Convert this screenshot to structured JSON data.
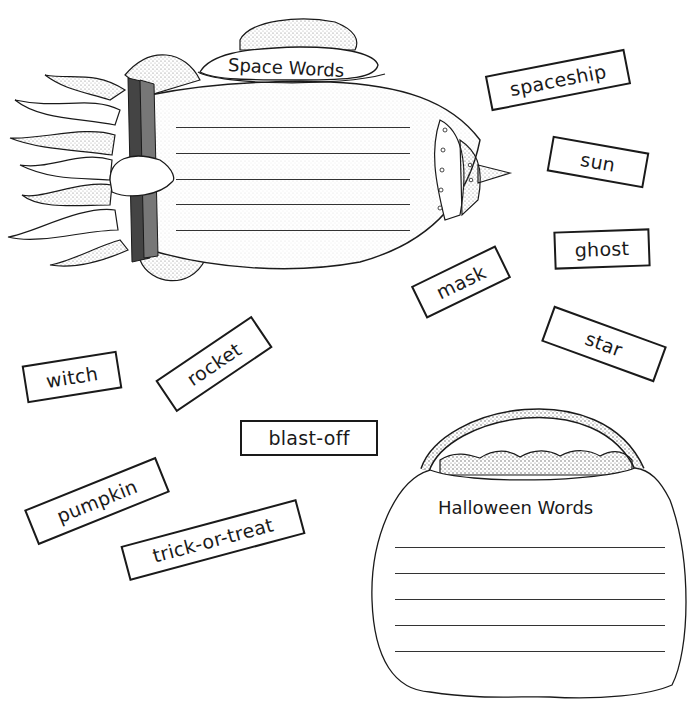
{
  "worksheet": {
    "space_box": {
      "title": "Space Words",
      "line_count": 5
    },
    "halloween_box": {
      "title": "Halloween Words",
      "line_count": 5
    },
    "word_cards": [
      {
        "id": "spaceship",
        "label": "spaceship",
        "x": 487,
        "y": 60,
        "w": 142,
        "h": 36,
        "rot": -11
      },
      {
        "id": "sun",
        "label": "sun",
        "x": 549,
        "y": 145,
        "w": 98,
        "h": 36,
        "rot": 10
      },
      {
        "id": "ghost",
        "label": "ghost",
        "x": 554,
        "y": 230,
        "w": 96,
        "h": 38,
        "rot": -2
      },
      {
        "id": "mask",
        "label": "mask",
        "x": 415,
        "y": 263,
        "w": 94,
        "h": 36,
        "rot": -26
      },
      {
        "id": "star",
        "label": "star",
        "x": 544,
        "y": 325,
        "w": 120,
        "h": 38,
        "rot": 20
      },
      {
        "id": "witch",
        "label": "witch",
        "x": 24,
        "y": 356,
        "w": 96,
        "h": 38,
        "rot": -9
      },
      {
        "id": "rocket",
        "label": "rocket",
        "x": 158,
        "y": 342,
        "w": 114,
        "h": 38,
        "rot": -34
      },
      {
        "id": "blast-off",
        "label": "blast-off",
        "x": 240,
        "y": 420,
        "w": 138,
        "h": 36,
        "rot": 0
      },
      {
        "id": "pumpkin",
        "label": "pumpkin",
        "x": 26,
        "y": 480,
        "w": 142,
        "h": 38,
        "rot": -22
      },
      {
        "id": "trick-or-treat",
        "label": "trick-or-treat",
        "x": 122,
        "y": 520,
        "w": 182,
        "h": 36,
        "rot": -15
      }
    ]
  },
  "colors": {
    "ink": "#1a1a1a",
    "paper": "#ffffff",
    "shade": "#555555"
  }
}
